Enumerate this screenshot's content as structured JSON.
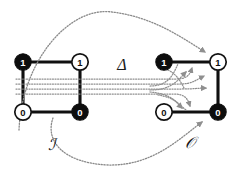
{
  "figure": {
    "background_color": "#ffffff",
    "ink_color": "#101010",
    "dotted_color": "#8f8f8f",
    "width": 235,
    "height": 173
  },
  "labels": {
    "transform": "Δ",
    "input_structure": "ℐ",
    "output_structure": "𝒪"
  },
  "left_structure": {
    "name": "I",
    "caption": "ℐ",
    "nodes": [
      {
        "id": "i-top-left",
        "value": "1",
        "fill": "dark",
        "x": 23,
        "y": 62
      },
      {
        "id": "i-top-right",
        "value": "1",
        "fill": "light",
        "x": 80,
        "y": 62
      },
      {
        "id": "i-bottom-left",
        "value": "0",
        "fill": "light",
        "x": 23,
        "y": 112
      },
      {
        "id": "i-bottom-right",
        "value": "0",
        "fill": "dark",
        "x": 80,
        "y": 112
      }
    ],
    "edges": [
      {
        "from": "i-top-left",
        "to": "i-top-right"
      },
      {
        "from": "i-top-left",
        "to": "i-bottom-left"
      },
      {
        "from": "i-top-right",
        "to": "i-bottom-right"
      },
      {
        "from": "i-bottom-left",
        "to": "i-bottom-right"
      }
    ]
  },
  "right_structure": {
    "name": "O",
    "caption": "𝒪",
    "nodes": [
      {
        "id": "o-top-left",
        "value": "1",
        "fill": "dark",
        "x": 164,
        "y": 62
      },
      {
        "id": "o-top-right",
        "value": "1",
        "fill": "light",
        "x": 218,
        "y": 62
      },
      {
        "id": "o-bottom-left",
        "value": "0",
        "fill": "light",
        "x": 164,
        "y": 112
      },
      {
        "id": "o-bottom-right",
        "value": "0",
        "fill": "dark",
        "x": 218,
        "y": 112
      }
    ],
    "edges": [
      {
        "from": "o-top-left",
        "to": "o-top-right"
      },
      {
        "from": "o-top-right",
        "to": "o-bottom-right"
      },
      {
        "from": "o-bottom-left",
        "to": "o-bottom-right"
      }
    ]
  },
  "mappings": [
    {
      "id": "map-over-top",
      "kind": "arc-over",
      "from": "i-top-left",
      "to": "o-top-right"
    },
    {
      "id": "map-under-bottom",
      "kind": "arc-under",
      "from": "i-bottom-right",
      "to": "o-bottom-right"
    },
    {
      "id": "map-band-1",
      "kind": "horizontal",
      "from": "i-top-left",
      "to": "o-top-right"
    },
    {
      "id": "map-band-2",
      "kind": "horizontal",
      "from": "i-top-right",
      "to": "o-top-right"
    },
    {
      "id": "map-band-3",
      "kind": "horizontal",
      "from": "i-bottom-left",
      "to": "o-bottom-right"
    },
    {
      "id": "map-band-4",
      "kind": "horizontal",
      "from": "i-bottom-right",
      "to": "o-bottom-right"
    }
  ]
}
